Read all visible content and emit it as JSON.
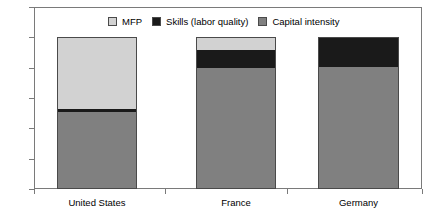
{
  "chart_data": {
    "type": "bar",
    "subtype": "stacked-bar",
    "title": "",
    "subtitle": "",
    "xlabel": "",
    "ylabel": "",
    "categories": [
      "United States",
      "France",
      "Germany"
    ],
    "series": [
      {
        "name": "Capital intensity",
        "color": "#808080",
        "values": [
          51,
          80,
          81
        ]
      },
      {
        "name": "Skills (labor quality)",
        "color": "#1a1a1a",
        "values": [
          2,
          12,
          19
        ]
      },
      {
        "name": "MFP",
        "color": "#d2d2d2",
        "values": [
          47,
          8,
          0
        ]
      }
    ],
    "stack_totals": [
      100,
      100,
      100
    ],
    "ylim": [
      0,
      120
    ],
    "ytick_values": [
      0,
      20,
      40,
      60,
      80,
      100,
      120
    ],
    "ytick_labels": [
      "0",
      "20",
      "40",
      "60",
      "80",
      "100",
      "120"
    ],
    "grid": false,
    "legend_position": "top-inside",
    "legend_order": [
      "MFP",
      "Skills (labor quality)",
      "Capital intensity"
    ],
    "frame": true
  },
  "legend": {
    "items": [
      {
        "label": "MFP",
        "color": "#d2d2d2"
      },
      {
        "label": "Skills (labor quality)",
        "color": "#1a1a1a"
      },
      {
        "label": "Capital intensity",
        "color": "#808080"
      }
    ]
  },
  "axes": {
    "y": {
      "ticks": [
        {
          "label": "120",
          "value": 120
        },
        {
          "label": "100",
          "value": 100
        },
        {
          "label": "80",
          "value": 80
        },
        {
          "label": "60",
          "value": 60
        },
        {
          "label": "40",
          "value": 40
        },
        {
          "label": "20",
          "value": 20
        },
        {
          "label": "0",
          "value": 0
        }
      ]
    },
    "x": {
      "labels": [
        "United States",
        "France",
        "Germany"
      ]
    }
  }
}
